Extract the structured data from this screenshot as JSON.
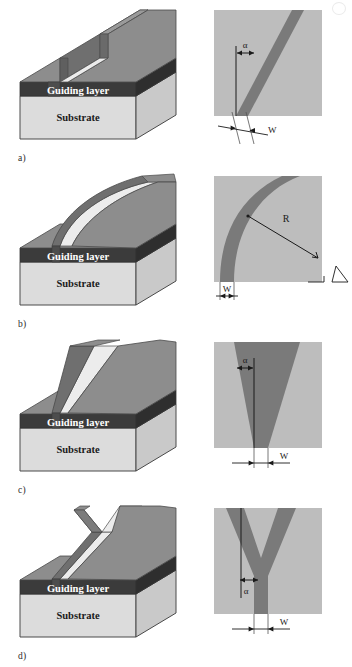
{
  "figure": {
    "caption_marks": {
      "corner": "page-corner-mark"
    },
    "layer_labels": {
      "guiding": "Guiding layer",
      "substrate": "Substrate"
    },
    "colors": {
      "page_background": "#ffffff",
      "substrate_face": "#dcdcdc",
      "substrate_side": "#c9c9c9",
      "guiding_layer": "#3b3b3b",
      "guiding_layer_text": "#ffffff",
      "top_surface": "#8d8d8d",
      "ridge_top": "#8d8d8d",
      "ridge_side_light": "#e3e3e3",
      "ridge_side_dark": "#6f6f6f",
      "topview_background": "#bdbdbd",
      "topview_stripe": "#7a7a7a",
      "line": "#1a1a1a"
    },
    "symbols": {
      "alpha": "α",
      "width": "W",
      "radius": "R"
    }
  },
  "panels": [
    {
      "id": "a",
      "label": "a)",
      "kind": "straight-tilted-ridge-waveguide",
      "perspective": {
        "name": "ridge-waveguide-3d-a",
        "guiding_label": "Guiding layer",
        "substrate_label": "Substrate"
      },
      "topview": {
        "name": "topview-straight-tilted",
        "annotations": [
          {
            "symbol": "α",
            "role": "tilt-angle"
          },
          {
            "symbol": "W",
            "role": "waveguide-width"
          }
        ]
      }
    },
    {
      "id": "b",
      "label": "b)",
      "kind": "curved-bend-ridge-waveguide",
      "perspective": {
        "name": "ridge-waveguide-3d-b",
        "guiding_label": "Guiding layer",
        "substrate_label": "Substrate"
      },
      "topview": {
        "name": "topview-curved-bend",
        "annotations": [
          {
            "symbol": "R",
            "role": "bend-radius"
          },
          {
            "symbol": "W",
            "role": "waveguide-width"
          }
        ]
      }
    },
    {
      "id": "c",
      "label": "c)",
      "kind": "tapered-ridge-waveguide",
      "perspective": {
        "name": "ridge-waveguide-3d-c",
        "guiding_label": "Guiding layer",
        "substrate_label": "Substrate"
      },
      "topview": {
        "name": "topview-taper",
        "annotations": [
          {
            "symbol": "α",
            "role": "taper-angle"
          },
          {
            "symbol": "W",
            "role": "waveguide-width"
          }
        ]
      }
    },
    {
      "id": "d",
      "label": "d)",
      "kind": "y-branch-splitter-ridge-waveguide",
      "perspective": {
        "name": "ridge-waveguide-3d-d",
        "guiding_label": "Guiding layer",
        "substrate_label": "Substrate"
      },
      "topview": {
        "name": "topview-y-branch",
        "annotations": [
          {
            "symbol": "α",
            "role": "branching-angle"
          },
          {
            "symbol": "W",
            "role": "waveguide-width"
          }
        ]
      }
    }
  ]
}
